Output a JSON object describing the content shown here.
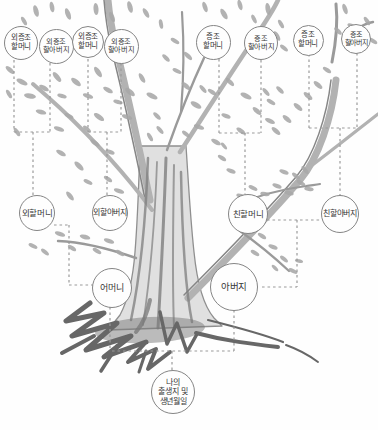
{
  "figure": {
    "kind": "hand-drawn family tree worksheet",
    "background": "#fefefe"
  },
  "palette": {
    "bg": "#fefefe",
    "node_fill": "#fefefe",
    "node_border": "#858585",
    "connector": "#9a9a9a",
    "text": "#383838",
    "foliage": "#a7a7a7",
    "branch": "#b2b2b2",
    "trunk_fill": "#e0e0e0",
    "trunk_line": "#8f8f8f",
    "roots": "#676767"
  },
  "nodes": [
    {
      "id": "maternal-great-grandmother-1",
      "lines": [
        "외증조",
        "할머니"
      ],
      "x": 21,
      "y": 43,
      "r": 17,
      "fs": 7.5
    },
    {
      "id": "maternal-great-grandfather-1",
      "lines": [
        "외증조",
        "할아버지"
      ],
      "x": 56,
      "y": 46,
      "r": 17.5,
      "fs": 7.2
    },
    {
      "id": "maternal-great-grandmother-2",
      "lines": [
        "외증조",
        "할머니"
      ],
      "x": 88,
      "y": 42,
      "r": 16,
      "fs": 7.5
    },
    {
      "id": "maternal-great-grandfather-2",
      "lines": [
        "외증조",
        "할아버지"
      ],
      "x": 121,
      "y": 46,
      "r": 17.5,
      "fs": 7.2
    },
    {
      "id": "paternal-great-grandmother-1",
      "lines": [
        "증조",
        "할머니"
      ],
      "x": 213,
      "y": 42,
      "r": 17.5,
      "fs": 7.5
    },
    {
      "id": "paternal-great-grandfather-1",
      "lines": [
        "증조",
        "할아버지"
      ],
      "x": 261,
      "y": 43,
      "r": 17,
      "fs": 7.2
    },
    {
      "id": "paternal-great-grandmother-2",
      "lines": [
        "증조",
        "할머니"
      ],
      "x": 308,
      "y": 40,
      "r": 15.5,
      "fs": 7.5
    },
    {
      "id": "paternal-great-grandfather-2",
      "lines": [
        "증조",
        "할아버지"
      ],
      "x": 356,
      "y": 39,
      "r": 15,
      "fs": 7
    },
    {
      "id": "maternal-grandmother",
      "lines": [
        "외할머니"
      ],
      "x": 37,
      "y": 213,
      "r": 18,
      "fs": 8.5
    },
    {
      "id": "maternal-grandfather",
      "lines": [
        "외할아버지"
      ],
      "x": 110,
      "y": 213,
      "r": 18,
      "fs": 8
    },
    {
      "id": "paternal-grandmother",
      "lines": [
        "친할머니"
      ],
      "x": 248,
      "y": 214,
      "r": 20,
      "fs": 8.5
    },
    {
      "id": "paternal-grandfather",
      "lines": [
        "친할아버지"
      ],
      "x": 340,
      "y": 214,
      "r": 19,
      "fs": 8
    },
    {
      "id": "mother",
      "lines": [
        "어머니"
      ],
      "x": 112,
      "y": 288,
      "r": 20,
      "fs": 9
    },
    {
      "id": "father",
      "lines": [
        "아버지"
      ],
      "x": 234,
      "y": 287,
      "r": 24,
      "fs": 9.5
    },
    {
      "id": "self-birth",
      "lines": [
        "나의",
        "출생지 및",
        "생년월일"
      ],
      "x": 173,
      "y": 392,
      "r": 22,
      "fs": 8
    }
  ],
  "connectors": [
    [
      14,
      60,
      14,
      132
    ],
    [
      50,
      63,
      50,
      132
    ],
    [
      14,
      132,
      50,
      132
    ],
    [
      33,
      132,
      33,
      196
    ],
    [
      88,
      59,
      88,
      132
    ],
    [
      121,
      63,
      121,
      132
    ],
    [
      88,
      132,
      121,
      132
    ],
    [
      107,
      132,
      107,
      196
    ],
    [
      219,
      59,
      219,
      133
    ],
    [
      261,
      60,
      261,
      133
    ],
    [
      219,
      133,
      261,
      133
    ],
    [
      245,
      133,
      245,
      195
    ],
    [
      309,
      54,
      309,
      128
    ],
    [
      357,
      53,
      357,
      128
    ],
    [
      309,
      128,
      357,
      128
    ],
    [
      340,
      128,
      340,
      196
    ],
    [
      54,
      225,
      69,
      225
    ],
    [
      69,
      225,
      69,
      285
    ],
    [
      69,
      285,
      93,
      285
    ],
    [
      267,
      220,
      321,
      220
    ],
    [
      297,
      220,
      297,
      287
    ],
    [
      262,
      287,
      297,
      287
    ],
    [
      110,
      307,
      110,
      350
    ],
    [
      234,
      310,
      234,
      351
    ],
    [
      112,
      351,
      234,
      351
    ],
    [
      172,
      351,
      172,
      372
    ]
  ]
}
